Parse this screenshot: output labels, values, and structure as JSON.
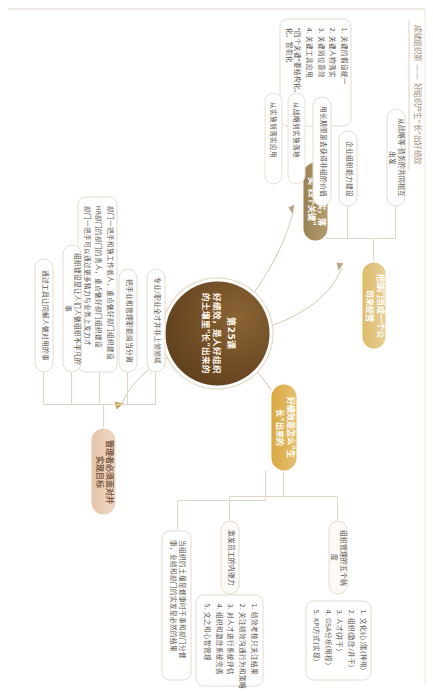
{
  "document": {
    "title": "成就组织第 —— 好组织产生\"长\"出好绩效",
    "orientation": "rotated-90"
  },
  "colors": {
    "core": "#6d4a23",
    "gold": "#d9a941",
    "gold_dark": "#9c8352",
    "gold_mid": "#ddbb6a",
    "blush": "#e6c5aa",
    "line": "#e0d5c4",
    "text": "#5b534c"
  },
  "center": {
    "lesson": "第25课",
    "headline": "好绩效，是人好组织的土壤里\"长\"出来的"
  },
  "branches": [
    {
      "id": "branch-shisi",
      "label": "把虑做实，落实\"四个关键\"",
      "color": "#9c8352",
      "children": [
        {
          "type": "list",
          "name": "four-keys-list",
          "items": [
            "1. 关键的假设统一",
            "2. 关键人物落实",
            "3. 关键岗位靠效",
            "4. 关键工具应用",
            "\"四个关键\"要结构化、制度化、智能化"
          ]
        }
      ]
    },
    {
      "id": "branch-company",
      "label": "把部门当成一个公司来经营",
      "color": "#ddbb6a",
      "children": [
        {
          "type": "cap",
          "name": "cap-strategy",
          "text": "从战略等·债务的共同相互出发"
        },
        {
          "type": "cap",
          "name": "cap-capability",
          "text": "企业组织能力建设"
        },
        {
          "type": "cap",
          "name": "cap-vision",
          "text": "用长期愿景去获得非组的价值"
        },
        {
          "type": "group",
          "name": "group-implementation",
          "rows": [
            "从战略到实施落地",
            "从实施到落实应用"
          ]
        }
      ]
    },
    {
      "id": "branch-growth",
      "label": "好绩效是怎么\"生长\"出来的",
      "color": "#d9a941",
      "children": [
        {
          "type": "cap",
          "name": "cap-five-dimensions",
          "text": "组织管理的五个纳度"
        },
        {
          "type": "cap-wide",
          "name": "cap-motivation",
          "text": "激发员工的内驱力"
        },
        {
          "type": "list",
          "name": "five-dimensions-list",
          "items": [
            "1. 文化(心)策(种用)",
            "2. 组织(激励/并干)",
            "3. 人才(并干)",
            "4. GSA分析(用程)",
            "5. KPI方式(实现)"
          ]
        },
        {
          "type": "list",
          "name": "motivation-list",
          "items": [
            "1. 绩效考核只关注结果",
            "2. 关注绩效沟通行为和策略",
            "3. 对人才进行系统评估",
            "4. 组织和激励系统完善",
            "5. 文之和心智管理"
          ]
        },
        {
          "type": "cap-wide",
          "name": "cap-health",
          "text": "当组织的土壤是健康时干事和部门分健康，业绩和部门的实发是必然的结果"
        }
      ]
    },
    {
      "id": "branch-manager",
      "label": "管理者必须面对并实现目标",
      "color": "#e6c5aa",
      "children": [
        {
          "type": "cap",
          "name": "cap-professional",
          "text": "专业/职业全才并非上领领域"
        },
        {
          "type": "cap",
          "name": "cap-hands-on",
          "text": "把手业和管理职能岗当分离"
        },
        {
          "type": "list",
          "name": "manager-list",
          "items": [
            "部门一把手和施工作者人，重点做好部门组织建设",
            "HR部门的部门的责人，重点做好部门组织建设",
            "部门一把手可以通过更多精力与业务上发力才"
          ]
        },
        {
          "type": "cap",
          "name": "cap-org-nature",
          "text": "组织建设是让人们人做组织不平凡的事"
        },
        {
          "type": "cap",
          "name": "cap-tools",
          "text": "通过工具让同解人做对用的事"
        }
      ]
    }
  ]
}
